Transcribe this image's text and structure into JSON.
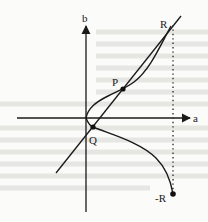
{
  "diagram": {
    "axes": {
      "x_label": "a",
      "y_label": "b"
    },
    "points": [
      {
        "id": "P",
        "label": "P"
      },
      {
        "id": "Q",
        "label": "Q"
      },
      {
        "id": "R",
        "label": "R"
      },
      {
        "id": "negR",
        "label": "-R"
      }
    ],
    "elements": {
      "curve": "cubic curve through Q, P, R and -R",
      "secant": "straight line through Q, P and R",
      "reflection": "dotted vertical line joining R and -R"
    },
    "colors": {
      "ink": "#1a1a1a",
      "paper": "#fbfbf9",
      "bleed": "#e6e6e2"
    }
  }
}
